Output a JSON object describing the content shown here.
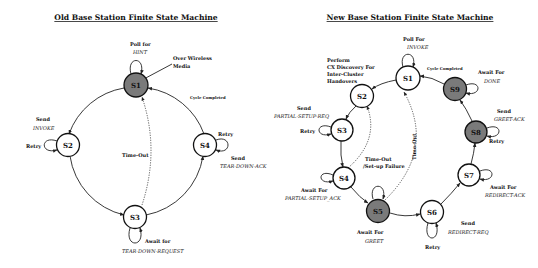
{
  "colors": {
    "state_normal": "#ffffff",
    "state_highlight": "#7a7a7a",
    "stroke": "#111111"
  },
  "old_fsm": {
    "title": "Old Base Station Finite State Machine",
    "states": [
      {
        "id": "S1",
        "highlighted": true
      },
      {
        "id": "S2",
        "highlighted": false
      },
      {
        "id": "S3",
        "highlighted": false
      },
      {
        "id": "S4",
        "highlighted": false
      }
    ],
    "labels": {
      "poll_for": "Poll for",
      "hint": "HINT",
      "over_wireless_1": "Over Wireless",
      "over_wireless_2": "Media",
      "cycle_completed": "Cycle Completed",
      "send_invoke_1": "Send",
      "send_invoke_2": "INVOKE",
      "retry_s2": "Retry",
      "time_out": "Time-Out",
      "retry_s4": "Retry",
      "send_teardown_ack_1": "Send",
      "send_teardown_ack_2": "TEAR-DOWN-ACK",
      "await_for": "Await for",
      "teardown_request": "TEAR-DOWN-REQUEST"
    }
  },
  "new_fsm": {
    "title": "New Base Station Finite State Machine",
    "states": [
      {
        "id": "S1",
        "highlighted": false
      },
      {
        "id": "S2",
        "highlighted": false
      },
      {
        "id": "S3",
        "highlighted": false
      },
      {
        "id": "S4",
        "highlighted": false
      },
      {
        "id": "S5",
        "highlighted": true
      },
      {
        "id": "S6",
        "highlighted": false
      },
      {
        "id": "S7",
        "highlighted": false
      },
      {
        "id": "S8",
        "highlighted": true
      },
      {
        "id": "S9",
        "highlighted": true
      }
    ],
    "labels": {
      "poll_for": "Poll For",
      "invoke": "INVOKE",
      "cycle_completed": "Cycle Completed",
      "perform_1": "Perform",
      "perform_2": "CX Discovery For",
      "perform_3": "Inter-Cluster",
      "perform_4": "Handovers",
      "await_done_1": "Await For",
      "await_done_2": "DONE",
      "send_partial_1": "Send",
      "send_partial_2": "PARTIAL-SETUP-REQ",
      "retry_s3": "Retry",
      "send_greet_ack_1": "Send",
      "send_greet_ack_2": "GREET-ACK",
      "retry_s8": "Retry",
      "time_out_v": "Time-Out",
      "timeout_setup_1": "Time-Out",
      "timeout_setup_2": "/Set-up Failure",
      "await_partial_1": "Await For",
      "await_partial_2": "PARTIAL-SETUP_ACK",
      "await_redirect_1": "Await For",
      "await_redirect_2": "REDIRECT-ACK",
      "await_greet_1": "Await For",
      "await_greet_2": "GREET",
      "send_redirect_1": "Send",
      "send_redirect_2": "REDIRECT-REQ",
      "retry_s6": "Retry"
    }
  }
}
